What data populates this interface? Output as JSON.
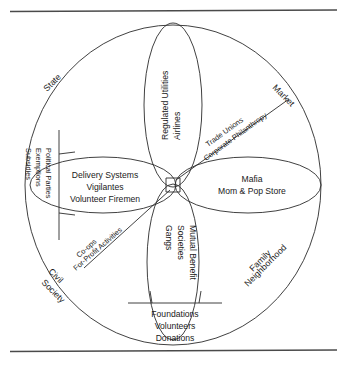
{
  "figure": {
    "line_color": "#2b2b2b",
    "rule_color": "#4a4a4a",
    "background": "#ffffff"
  },
  "arc_labels": {
    "state": "State",
    "market": "Market",
    "civil_society_line1": "Civil",
    "civil_society_line2": "Society",
    "family_line1": "Family",
    "family_line2": "Neighborhood"
  },
  "petals": {
    "top": {
      "line1": "Regulated Utilities",
      "line2": "Airlines"
    },
    "left": {
      "line1": "Delivery Systems",
      "line2": "Vigilantes",
      "line3": "Volunteer Firemen"
    },
    "right": {
      "line1": "Mafia",
      "line2": "Mom & Pop Store"
    },
    "bottom": {
      "line1": "Mutual Benefit",
      "line2": "Societies",
      "line3": "Gangs"
    }
  },
  "diagonals": {
    "upper_right_above": "Trade Unions",
    "upper_right_below": "Corporate Philanthropy",
    "lower_left_above": "Co-ops",
    "lower_left_below": "For-Profit Activities"
  },
  "brackets": {
    "left": {
      "line1": "Political Parties",
      "line2": "Exemptions",
      "line3": "Subsidies"
    },
    "bottom": {
      "line1": "Foundations",
      "line2": "Volunteers",
      "line3": "Donations"
    }
  }
}
